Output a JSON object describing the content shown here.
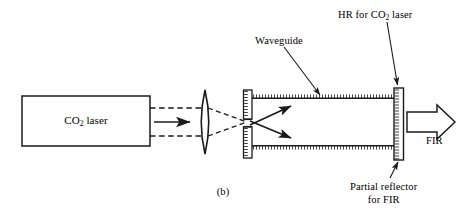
{
  "figure": {
    "panel_label": "(b)",
    "domain": "optics-schematic",
    "background_color": "#ffffff",
    "stroke_color": "#1a1a1a"
  },
  "labels": {
    "laser_box": "CO2 laser",
    "laser_box_prefix": "CO",
    "laser_box_sub": "2",
    "laser_box_suffix": " laser",
    "waveguide": "Waveguide",
    "hr_prefix": "HR for CO",
    "hr_sub": "2",
    "hr_suffix": " laser",
    "partial_reflector_line1": "Partial reflector",
    "partial_reflector_line2": "for FIR",
    "fir_output": "FIR"
  },
  "components": [
    {
      "name": "co2-laser-box",
      "type": "rectangle",
      "x": 22,
      "y": 96,
      "width": 128,
      "height": 50
    },
    {
      "name": "focusing-lens",
      "type": "biconvex-lens",
      "cx": 205,
      "cy": 122,
      "half_height": 32,
      "bulge": 7
    },
    {
      "name": "entrance-mirror",
      "type": "hatched-vertical-bar",
      "x": 243,
      "y": 90,
      "width": 9,
      "height": 68,
      "aperture_y": 121,
      "aperture_height": 6
    },
    {
      "name": "waveguide-wall-top",
      "type": "hatched-horizontal-line",
      "x1": 252,
      "x2": 395,
      "y": 98
    },
    {
      "name": "waveguide-wall-bottom",
      "type": "hatched-horizontal-line",
      "x1": 252,
      "x2": 395,
      "y": 146
    },
    {
      "name": "output-mirror",
      "type": "hatched-vertical-bar",
      "x": 393,
      "y": 88,
      "width": 10,
      "height": 72
    },
    {
      "name": "fir-output-arrow",
      "type": "block-arrow",
      "x": 406,
      "y": 110,
      "length": 48,
      "thickness": 22
    }
  ],
  "beams": [
    {
      "name": "beam-edge-upper",
      "style": "dashed",
      "points": "150,108 205,108"
    },
    {
      "name": "beam-edge-lower",
      "style": "dashed",
      "points": "150,136 205,136"
    },
    {
      "name": "beam-converge-upper",
      "style": "dashed",
      "points": "205,108 248,122"
    },
    {
      "name": "beam-converge-lower",
      "style": "dashed",
      "points": "205,136 248,122"
    },
    {
      "name": "beam-axis-arrow",
      "style": "solid-arrow",
      "points": "155,122 190,122"
    },
    {
      "name": "ray-diverge-up",
      "style": "solid-arrow",
      "points": "250,124 293,106"
    },
    {
      "name": "ray-diverge-down",
      "style": "solid-arrow",
      "points": "250,121 293,138"
    }
  ],
  "leader_lines": [
    {
      "name": "leader-waveguide",
      "from": "285,48",
      "to": "320,97"
    },
    {
      "name": "leader-hr",
      "from": "388,22",
      "to": "398,87"
    },
    {
      "name": "leader-partial-reflector",
      "from": "390,178",
      "to": "399,160"
    }
  ]
}
